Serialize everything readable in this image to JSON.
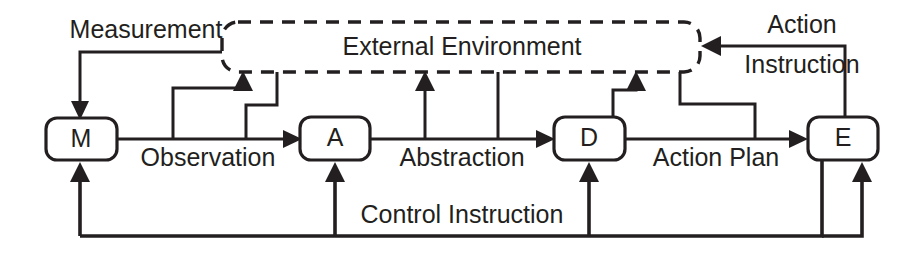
{
  "diagram": {
    "colors": {
      "ink": "#231f20",
      "background": "#ffffff"
    },
    "environment": {
      "label": "External Environment",
      "style": "dashed-rounded-rect"
    },
    "nodes": [
      {
        "id": "M",
        "label": "M",
        "name": "measurement-node"
      },
      {
        "id": "A",
        "label": "A",
        "name": "abstraction-node"
      },
      {
        "id": "D",
        "label": "D",
        "name": "decision-node"
      },
      {
        "id": "E",
        "label": "E",
        "name": "execution-node"
      }
    ],
    "edges": [
      {
        "id": "measurement",
        "label": "Measurement",
        "from": "External Environment",
        "to": "M"
      },
      {
        "id": "observation",
        "label": "Observation",
        "from": "M",
        "to": "A"
      },
      {
        "id": "abstraction",
        "label": "Abstraction",
        "from": "A",
        "to": "D"
      },
      {
        "id": "action-plan",
        "label": "Action Plan",
        "from": "D",
        "to": "E"
      },
      {
        "id": "action-instruction",
        "label": "Action Instruction",
        "from": "E",
        "to": "External Environment"
      },
      {
        "id": "control-instruction",
        "label": "Control Instruction",
        "from": "E",
        "to": "M, A, D"
      }
    ],
    "edge_label_lines": {
      "action_instruction_line1": "Action",
      "action_instruction_line2": "Instruction"
    }
  }
}
